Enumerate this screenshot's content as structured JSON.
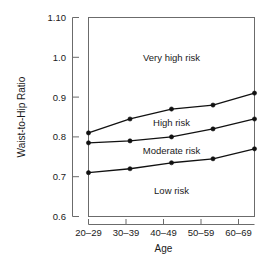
{
  "chart_data": {
    "type": "line",
    "title": "",
    "xlabel": "Age",
    "ylabel": "Waist-to-Hip Ratio",
    "categories": [
      "20–29",
      "30–39",
      "40–49",
      "50–59",
      "60–69"
    ],
    "ylim": [
      0.6,
      1.1
    ],
    "ytick_labels": [
      "0.6",
      "0.7",
      "0.8",
      "0.9",
      "1.0",
      "1.10"
    ],
    "ytick_values": [
      0.6,
      0.7,
      0.8,
      0.9,
      1.0,
      1.1
    ],
    "grid": false,
    "legend": "none",
    "series": [
      {
        "name": "Very high risk threshold",
        "values": [
          0.81,
          0.845,
          0.87,
          0.88,
          0.91
        ]
      },
      {
        "name": "High risk threshold",
        "values": [
          0.785,
          0.79,
          0.8,
          0.82,
          0.845
        ]
      },
      {
        "name": "Moderate risk threshold",
        "values": [
          0.71,
          0.72,
          0.735,
          0.745,
          0.77
        ]
      }
    ],
    "annotations": [
      {
        "text": "Very high risk",
        "x_category": "40–49",
        "y": 1.0
      },
      {
        "text": "High risk",
        "x_category": "40–49",
        "y": 0.835
      },
      {
        "text": "Moderate risk",
        "x_category": "40–49",
        "y": 0.765
      },
      {
        "text": "Low risk",
        "x_category": "40–49",
        "y": 0.665
      }
    ]
  },
  "axes": {
    "y_title": "Waist-to-Hip Ratio",
    "x_title": "Age",
    "y_ticks": [
      "1.10",
      "1.0",
      "0.9",
      "0.8",
      "0.7",
      "0.6"
    ],
    "x_ticks": [
      "20–29",
      "30–39",
      "40–49",
      "50–59",
      "60–69"
    ]
  },
  "regions": {
    "very_high": "Very high risk",
    "high": "High risk",
    "moderate": "Moderate risk",
    "low": "Low risk"
  },
  "colors": {
    "line": "#111111",
    "frame": "#6b6b6b",
    "text": "#1a1a1a",
    "background": "#ffffff"
  }
}
